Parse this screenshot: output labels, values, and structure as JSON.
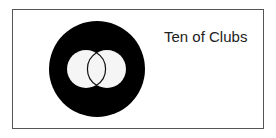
{
  "card": {
    "label": "Ten of Clubs",
    "border_color": "#555555"
  },
  "figure": {
    "outer_circle": {
      "cx": 97,
      "cy": 69,
      "r": 48,
      "fill": "#000000"
    },
    "inner_circles": [
      {
        "cx": 86,
        "cy": 69,
        "r": 19,
        "fill": "#f5f5f5"
      },
      {
        "cx": 107,
        "cy": 69,
        "r": 19,
        "fill": "#f5f5f5"
      }
    ],
    "lens_outline_color": "#111111"
  }
}
